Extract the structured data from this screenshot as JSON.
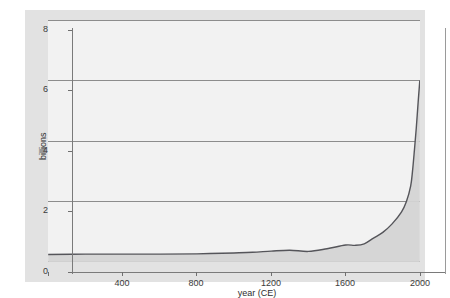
{
  "chart_data": {
    "type": "area",
    "title": "",
    "xlabel": "year (CE)",
    "ylabel": "billions",
    "xlim": [
      0,
      2000
    ],
    "ylim": [
      0,
      8
    ],
    "xticks": [
      400,
      800,
      1200,
      1600,
      2000
    ],
    "xtick_labels": [
      "400",
      "800",
      "1200",
      "1600",
      "2000"
    ],
    "yticks": [
      0,
      2,
      4,
      6,
      8
    ],
    "ytick_labels": [
      "0",
      "2",
      "4",
      "6",
      "8"
    ],
    "grid": true,
    "legend": null,
    "series": [
      {
        "name": "world population",
        "x": [
          1,
          200,
          400,
          600,
          800,
          1000,
          1100,
          1200,
          1300,
          1400,
          1500,
          1600,
          1650,
          1700,
          1750,
          1800,
          1850,
          1900,
          1927,
          1950,
          1960,
          1970,
          1980,
          1990,
          1999
        ],
        "values": [
          0.25,
          0.26,
          0.26,
          0.26,
          0.27,
          0.3,
          0.32,
          0.36,
          0.39,
          0.35,
          0.44,
          0.56,
          0.55,
          0.6,
          0.79,
          0.98,
          1.26,
          1.65,
          2.0,
          2.52,
          3.02,
          3.7,
          4.43,
          5.28,
          6.0
        ]
      }
    ]
  },
  "axes": {
    "y_label": "billions",
    "x_label": "year (CE)"
  },
  "colors": {
    "figure_background": "#e2e2e2",
    "plot_background": "#f2f2f2",
    "gridline": "#8d8d8d",
    "axis": "#7a7a7a",
    "curve": "#55555a",
    "fill": "#d4d4d4",
    "text": "#2e2e2e"
  }
}
